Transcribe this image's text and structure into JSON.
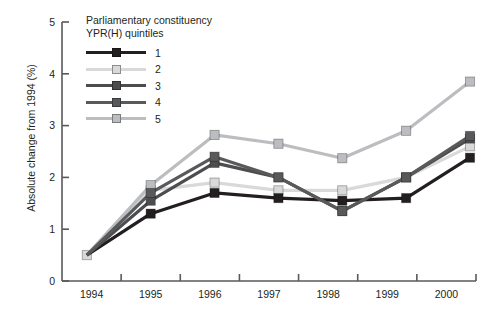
{
  "figure": {
    "cut_off_top_text": "",
    "legend": {
      "title_line1": "Parliamentary constituency",
      "title_line2": "YPR(H) quintiles",
      "entries": [
        {
          "label": "1",
          "color": "#231f20"
        },
        {
          "label": "2",
          "color": "#d9d9d9"
        },
        {
          "label": "3",
          "color": "#4d4d4f"
        },
        {
          "label": "4",
          "color": "#58595b"
        },
        {
          "label": "5",
          "color": "#bcbdc0"
        }
      ]
    }
  },
  "chart_data": {
    "type": "line",
    "title": "",
    "xlabel": "",
    "ylabel": "Absolute change from 1994 (%)",
    "categories": [
      "1994",
      "1995",
      "1996",
      "1997",
      "1998",
      "1999",
      "2000"
    ],
    "x_tick_labels": [
      "1994",
      "1995",
      "1996",
      "1997",
      "1998",
      "1999",
      "2000"
    ],
    "y_tick_labels": [
      "0",
      "1",
      "2",
      "3",
      "4",
      "5"
    ],
    "ylim": [
      0,
      5
    ],
    "yticks": [
      0,
      1,
      2,
      3,
      4,
      5
    ],
    "grid": false,
    "legend_position": "upper-left-inside",
    "marker": "square",
    "series": [
      {
        "name": "1",
        "color": "#231f20",
        "values": [
          0.5,
          1.3,
          1.7,
          1.6,
          1.55,
          1.6,
          2.38
        ]
      },
      {
        "name": "2",
        "color": "#d9d9d9",
        "values": [
          0.5,
          1.75,
          1.9,
          1.75,
          1.75,
          2.0,
          2.6
        ]
      },
      {
        "name": "3",
        "color": "#4d4d4f",
        "values": [
          0.5,
          1.55,
          2.28,
          2.0,
          1.35,
          2.0,
          2.75
        ]
      },
      {
        "name": "4",
        "color": "#58595b",
        "values": [
          0.5,
          1.7,
          2.4,
          2.0,
          1.35,
          2.0,
          2.8
        ]
      },
      {
        "name": "5",
        "color": "#bcbdc0",
        "values": [
          0.5,
          1.85,
          2.82,
          2.65,
          2.37,
          2.9,
          3.85
        ]
      }
    ]
  }
}
